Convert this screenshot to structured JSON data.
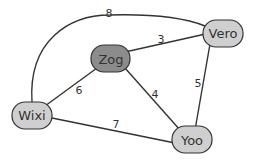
{
  "colors": {
    "node_fill": "#cfcfcf",
    "highlight_fill": "#8c8c8c",
    "stroke": "#333333",
    "background": "#ffffff"
  },
  "nodes": [
    {
      "id": "Zog",
      "label": "Zog",
      "highlighted": true
    },
    {
      "id": "Vero",
      "label": "Vero",
      "highlighted": false
    },
    {
      "id": "Wixi",
      "label": "Wixi",
      "highlighted": false
    },
    {
      "id": "Yoo",
      "label": "Yoo",
      "highlighted": false
    }
  ],
  "edges": [
    {
      "from": "Wixi",
      "to": "Vero",
      "weight": "8"
    },
    {
      "from": "Zog",
      "to": "Vero",
      "weight": "3"
    },
    {
      "from": "Zog",
      "to": "Wixi",
      "weight": "6"
    },
    {
      "from": "Zog",
      "to": "Yoo",
      "weight": "4"
    },
    {
      "from": "Vero",
      "to": "Yoo",
      "weight": "5"
    },
    {
      "from": "Wixi",
      "to": "Yoo",
      "weight": "7"
    }
  ]
}
